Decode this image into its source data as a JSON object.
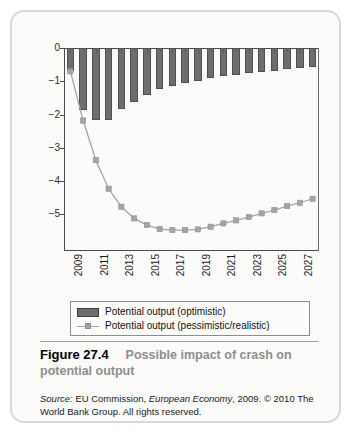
{
  "figure": {
    "number": "Figure 27.4",
    "title": "Possible impact of crash on potential output",
    "source_prefix": "Source:",
    "source_body_1": " EU Commission, ",
    "source_italic": "European Economy",
    "source_body_2": ", 2009. © 2010 The World Bank Group. All rights reserved."
  },
  "legend": {
    "items": [
      {
        "label": "Potential output (optimistic)",
        "marker": "bar-swatch",
        "color": "#6e6e6e"
      },
      {
        "label": "Potential output (pessimistic/realistic)",
        "marker": "line-square-swatch",
        "color": "#a5a5a5"
      }
    ]
  },
  "chart_data": {
    "type": "bar",
    "title": "Possible impact of crash on potential output",
    "xlabel": "",
    "ylabel": "",
    "ylim": [
      -6.1,
      0
    ],
    "yticks": [
      0,
      -1,
      -2,
      -3,
      -4,
      -5
    ],
    "ytick_labels": [
      "0",
      "−1",
      "−2",
      "−3",
      "−4",
      "−5"
    ],
    "grid": false,
    "legend_position": "below-axes",
    "x": [
      2009,
      2010,
      2011,
      2012,
      2013,
      2014,
      2015,
      2016,
      2017,
      2018,
      2019,
      2020,
      2021,
      2022,
      2023,
      2024,
      2025,
      2026,
      2027,
      2028
    ],
    "xtick_labels": [
      "2009",
      "2011",
      "2013",
      "2015",
      "2017",
      "2019",
      "2021",
      "2023",
      "2025",
      "2027"
    ],
    "xtick_years": [
      2009,
      2011,
      2013,
      2015,
      2017,
      2019,
      2021,
      2023,
      2025,
      2027
    ],
    "series": [
      {
        "name": "Potential output (optimistic)",
        "type": "bar",
        "color": "#6e6e6e",
        "values": [
          -0.7,
          -1.85,
          -2.15,
          -2.15,
          -1.82,
          -1.62,
          -1.4,
          -1.22,
          -1.15,
          -1.05,
          -0.98,
          -0.9,
          -0.84,
          -0.8,
          -0.76,
          -0.72,
          -0.68,
          -0.64,
          -0.6,
          -0.57
        ]
      },
      {
        "name": "Potential output (pessimistic/realistic)",
        "type": "line",
        "color": "#a5a5a5",
        "marker": "square",
        "values": [
          -0.7,
          -2.18,
          -3.37,
          -4.23,
          -4.77,
          -5.12,
          -5.32,
          -5.44,
          -5.47,
          -5.47,
          -5.45,
          -5.37,
          -5.27,
          -5.18,
          -5.08,
          -4.97,
          -4.87,
          -4.75,
          -4.65,
          -4.53
        ]
      }
    ]
  }
}
